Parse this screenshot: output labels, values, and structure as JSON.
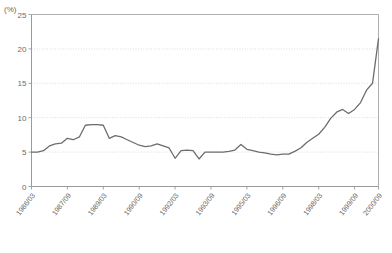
{
  "header": {
    "title_faint": "",
    "unit_label": "(%)"
  },
  "colors": {
    "line": "#6d6d6d",
    "axis": "#9a9a9a",
    "grid": "#cfcfcf",
    "text": "#6b6b6b",
    "background": "#ffffff"
  },
  "chart_data": {
    "type": "line",
    "title": "",
    "xlabel": "",
    "ylabel": "(%)",
    "ylim": [
      0,
      25
    ],
    "yticks": [
      0,
      5,
      10,
      15,
      20,
      25
    ],
    "grid": true,
    "legend": "none",
    "xtick_labels": [
      "1986/03",
      "1987/09",
      "1989/03",
      "1990/09",
      "1992/03",
      "1993/09",
      "1995/03",
      "1996/09",
      "1998/03",
      "1999/09",
      "2000/09"
    ],
    "xtick_indices": [
      0,
      6,
      12,
      18,
      24,
      30,
      36,
      42,
      48,
      54,
      58
    ],
    "x": [
      "1986/03",
      "1986/06",
      "1986/09",
      "1986/12",
      "1987/03",
      "1987/06",
      "1987/09",
      "1987/12",
      "1988/03",
      "1988/06",
      "1988/09",
      "1988/12",
      "1989/03",
      "1989/06",
      "1989/09",
      "1989/12",
      "1990/03",
      "1990/06",
      "1990/09",
      "1990/12",
      "1991/03",
      "1991/06",
      "1991/09",
      "1991/12",
      "1992/03",
      "1992/06",
      "1992/09",
      "1992/12",
      "1993/03",
      "1993/06",
      "1993/09",
      "1993/12",
      "1994/03",
      "1994/06",
      "1994/09",
      "1994/12",
      "1995/03",
      "1995/06",
      "1995/09",
      "1995/12",
      "1996/03",
      "1996/06",
      "1996/09",
      "1996/12",
      "1997/03",
      "1997/06",
      "1997/09",
      "1997/12",
      "1998/03",
      "1998/06",
      "1998/09",
      "1998/12",
      "1999/03",
      "1999/06",
      "1999/09",
      "1999/12",
      "2000/03",
      "2000/06",
      "2000/09"
    ],
    "series": [
      {
        "name": "ratio",
        "values": [
          5.0,
          5.0,
          5.2,
          5.9,
          6.2,
          6.3,
          7.0,
          6.8,
          7.2,
          8.9,
          9.0,
          9.0,
          8.9,
          7.0,
          7.4,
          7.2,
          6.8,
          6.4,
          6.0,
          5.8,
          5.9,
          6.2,
          5.9,
          5.6,
          4.1,
          5.2,
          5.3,
          5.2,
          4.0,
          5.0,
          5.0,
          5.0,
          5.0,
          5.1,
          5.3,
          6.1,
          5.4,
          5.2,
          5.0,
          4.9,
          4.7,
          4.6,
          4.7,
          4.7,
          5.1,
          5.6,
          6.4,
          7.0,
          7.6,
          8.6,
          9.9,
          10.8,
          11.2,
          10.6,
          11.2,
          12.2,
          14.0,
          15.0,
          21.5
        ]
      }
    ]
  }
}
